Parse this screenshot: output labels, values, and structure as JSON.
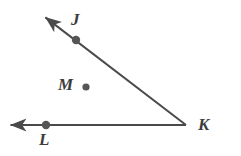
{
  "figure": {
    "type": "geometry-diagram",
    "background_color": "#ffffff",
    "stroke_color": "#4a4a4a",
    "dot_color": "#555555",
    "label_color": "#3c3c3c",
    "canvas": {
      "width": 241,
      "height": 156
    }
  },
  "labels": {
    "j": "J",
    "m": "M",
    "l": "L",
    "k": "K"
  },
  "geometry": {
    "vertex_k": {
      "x": 186,
      "y": 125
    },
    "ray_kj": {
      "name": "ray-KJ",
      "from": {
        "x": 186,
        "y": 125
      },
      "to": {
        "x": 41,
        "y": 14
      },
      "arrowhead": "end"
    },
    "ray_kl": {
      "name": "ray-KL",
      "from": {
        "x": 186,
        "y": 125
      },
      "to": {
        "x": 5,
        "y": 125
      },
      "arrowhead": "end"
    },
    "points": [
      {
        "name": "point-J",
        "x": 76,
        "y": 40,
        "radius": 4.2
      },
      {
        "name": "point-M",
        "x": 86,
        "y": 87,
        "radius": 3.6
      },
      {
        "name": "point-L",
        "x": 46,
        "y": 125,
        "radius": 4.2
      }
    ]
  }
}
